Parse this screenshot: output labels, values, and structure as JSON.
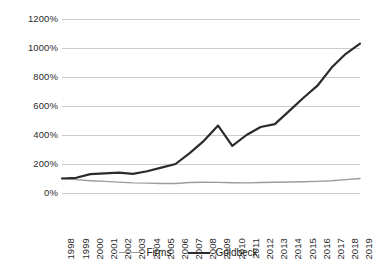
{
  "chart_data": {
    "type": "line",
    "title": "",
    "subtitle": "",
    "xlabel": "",
    "ylabel": "",
    "grid": true,
    "legend_position": "bottom",
    "ylim": [
      0,
      1200
    ],
    "ytick_values": [
      0,
      200,
      400,
      600,
      800,
      1000,
      1200
    ],
    "ytick_labels": [
      "0%",
      "200%",
      "400%",
      "600%",
      "800%",
      "1000%",
      "1200%"
    ],
    "categories": [
      "1998",
      "1999",
      "2000",
      "2001",
      "2002",
      "2003",
      "2004",
      "2005",
      "2006",
      "2007",
      "2008",
      "2009",
      "2010",
      "2011",
      "2012",
      "2013",
      "2014",
      "2015",
      "2016",
      "2017",
      "2018",
      "2019"
    ],
    "x": [
      "1998",
      "1999",
      "2000",
      "2001",
      "2002",
      "2003",
      "2004",
      "2005",
      "2006",
      "2007",
      "2008",
      "2009",
      "2010",
      "2011",
      "2012",
      "2013",
      "2014",
      "2015",
      "2016",
      "2017",
      "2018",
      "2019"
    ],
    "series": [
      {
        "name": "Firms",
        "color": "#9b9b9b",
        "width": 1.4,
        "values": [
          100,
          92,
          85,
          80,
          75,
          70,
          68,
          66,
          65,
          72,
          74,
          73,
          71,
          70,
          72,
          74,
          76,
          78,
          80,
          84,
          92,
          100
        ]
      },
      {
        "name": "Goldbeck",
        "color": "#2b2b2b",
        "width": 2.2,
        "values": [
          100,
          105,
          130,
          135,
          140,
          132,
          150,
          175,
          200,
          275,
          360,
          465,
          325,
          400,
          455,
          475,
          565,
          655,
          740,
          865,
          960,
          1030
        ]
      }
    ]
  },
  "legend": {
    "items": [
      {
        "label": "Firms",
        "key": "firms"
      },
      {
        "label": "Goldbeck",
        "key": "goldbeck"
      }
    ]
  },
  "colors": {
    "gridline": "#bfbfbf",
    "text": "#231f20",
    "firms": "#9b9b9b",
    "goldbeck": "#2b2b2b",
    "background": "#ffffff"
  }
}
